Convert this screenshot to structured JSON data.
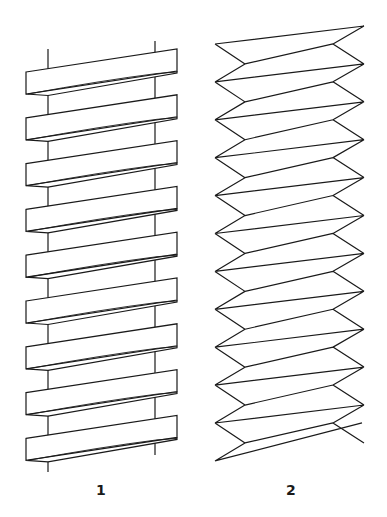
{
  "figures": [
    {
      "id": "1",
      "label": "1",
      "description": "Flat ribbon bands wound helically around two vertical rods",
      "rods": {
        "left_x": 48,
        "right_x": 155,
        "left_top_y": 49,
        "right_top_y": 41,
        "left_bottom_y": 472,
        "right_bottom_y": 455
      },
      "bands": {
        "count": 9,
        "left_x": 26,
        "right_x": 177,
        "first_left_top_y": 72,
        "rise": 23,
        "height": 22,
        "pitch": 45.8
      }
    },
    {
      "id": "2",
      "label": "2",
      "description": "Zigzag folded helix (accordion-style strip)",
      "zigzag": {
        "outer_left_x": 215,
        "inner_left_x": 245,
        "inner_right_x": 333,
        "outer_right_x": 364,
        "top_left_y": 44,
        "top_right_y": 26,
        "pitch": 37.9,
        "turns": 11
      }
    }
  ],
  "style": {
    "stroke_color": "#1a1a1a",
    "background": "#ffffff"
  }
}
